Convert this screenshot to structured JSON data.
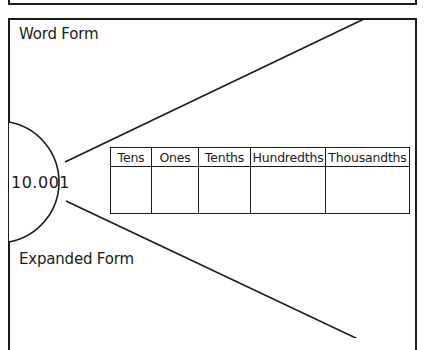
{
  "diagram": {
    "center_value": "10.001",
    "labels": {
      "word_form": "Word Form",
      "expanded_form": "Expanded Form"
    },
    "place_value_table": {
      "headers": [
        "Tens",
        "Ones",
        "Tenths",
        "Hundredths",
        "Thousandths"
      ],
      "cells": [
        "",
        "",
        "",
        "",
        ""
      ]
    },
    "colors": {
      "stroke": "#1a1a1a",
      "background": "#ffffff"
    }
  }
}
